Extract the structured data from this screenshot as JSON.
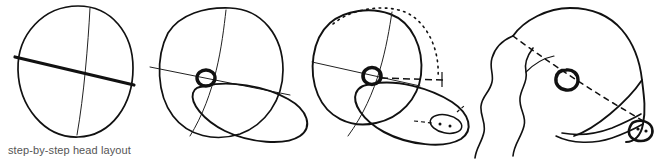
{
  "figure": {
    "caption": "step-by-step head layout",
    "caption_color": "#555555",
    "background_color": "#ffffff",
    "ink_color": "#111111",
    "construction_color": "#444444",
    "width": 660,
    "height": 167,
    "step_count": 4
  },
  "steps": [
    {
      "index": 1,
      "name": "cranium-circle-with-axes",
      "label": "step-1",
      "elements": [
        "skull-circle",
        "thick-horizontal-axis",
        "thin-vertical-axis"
      ]
    },
    {
      "index": 2,
      "name": "add-eye-and-muzzle-ellipse",
      "label": "step-2",
      "elements": [
        "skull-circle",
        "thin-horizontal-axis",
        "thin-vertical-axis",
        "eye-circle",
        "muzzle-ellipse"
      ]
    },
    {
      "index": 3,
      "name": "add-skull-dotted-arc-and-nose",
      "label": "step-3",
      "elements": [
        "skull-circle",
        "thin-horizontal-axis",
        "thin-vertical-axis",
        "eye-circle",
        "muzzle-ellipse",
        "dotted-skull-arc",
        "dashed-eye-level-line",
        "nose-ellipse-with-nostrils",
        "dashed-nose-guide"
      ]
    },
    {
      "index": 4,
      "name": "finished-head-rendering",
      "label": "step-4",
      "elements": [
        "head-outline",
        "wavy-ear-fur",
        "eye",
        "dashed-eye-to-nose-line",
        "nose-with-nostrils",
        "mouth-line",
        "jaw-line"
      ]
    }
  ]
}
